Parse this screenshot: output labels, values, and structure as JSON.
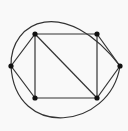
{
  "diagram": {
    "type": "graph",
    "background": "#f9f9f9",
    "edge_color": "#333333",
    "node_color": "#111111",
    "node_radius": 2.6,
    "nodes": [
      {
        "id": "top-left",
        "x": 35,
        "y": 34
      },
      {
        "id": "top-right",
        "x": 97,
        "y": 34
      },
      {
        "id": "left",
        "x": 11,
        "y": 66
      },
      {
        "id": "right",
        "x": 120,
        "y": 66
      },
      {
        "id": "bottom-left",
        "x": 35,
        "y": 98
      },
      {
        "id": "bottom-right",
        "x": 97,
        "y": 98
      }
    ],
    "edges": [
      {
        "from": "top-left",
        "to": "top-right"
      },
      {
        "from": "top-left",
        "to": "bottom-left"
      },
      {
        "from": "top-right",
        "to": "bottom-right"
      },
      {
        "from": "bottom-left",
        "to": "bottom-right"
      },
      {
        "from": "top-left",
        "to": "bottom-right"
      },
      {
        "from": "left",
        "to": "top-left"
      },
      {
        "from": "left",
        "to": "bottom-left"
      },
      {
        "from": "top-right",
        "to": "right"
      },
      {
        "from": "bottom-right",
        "to": "right"
      }
    ],
    "arcs": [
      {
        "from": "left",
        "to": "right",
        "path": "M 11 66 C 10 20, 65 -5, 120 66"
      },
      {
        "from": "right",
        "to": "left",
        "path": "M 120 66 C 110 130, 15 140, 11 66"
      }
    ]
  }
}
